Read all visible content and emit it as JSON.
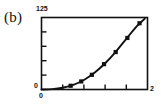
{
  "figure": {
    "panel_label": "(b)",
    "background_color": "#ffffff",
    "ink_color": "#111111"
  },
  "axis_labels": {
    "y_max": "125",
    "y_min": "0",
    "x_min": "0",
    "x_max": "2"
  },
  "chart_data": {
    "type": "line",
    "title": "(b)",
    "xlabel": "",
    "ylabel": "",
    "xlim": [
      0,
      2
    ],
    "ylim": [
      0,
      125
    ],
    "grid": false,
    "legend": null,
    "xticks": [
      0,
      0.4,
      0.8,
      1.2,
      1.6,
      2.0
    ],
    "xticklabels": [
      "0",
      "",
      "",
      "",
      "",
      "2"
    ],
    "yticks": [
      0,
      25,
      50,
      75,
      100,
      125
    ],
    "yticklabels": [
      "0",
      "",
      "",
      "",
      "",
      "125"
    ],
    "marker": "square",
    "line_color": "#111111",
    "series": [
      {
        "name": "curve",
        "x": [
          0.0,
          0.2,
          0.4,
          0.6,
          0.8,
          1.0,
          1.2,
          1.4,
          1.6,
          1.8,
          1.95
        ],
        "y": [
          0.0,
          0.6,
          3.0,
          8.0,
          16.5,
          29.0,
          45.5,
          65.5,
          88.0,
          110.0,
          123.0
        ]
      }
    ],
    "markers": [
      {
        "x": 0.55,
        "y": 6.5
      },
      {
        "x": 0.75,
        "y": 14.0
      },
      {
        "x": 0.95,
        "y": 25.5
      },
      {
        "x": 1.18,
        "y": 44.0
      },
      {
        "x": 1.4,
        "y": 65.0
      },
      {
        "x": 1.62,
        "y": 89.5
      },
      {
        "x": 1.85,
        "y": 115.0
      }
    ]
  }
}
